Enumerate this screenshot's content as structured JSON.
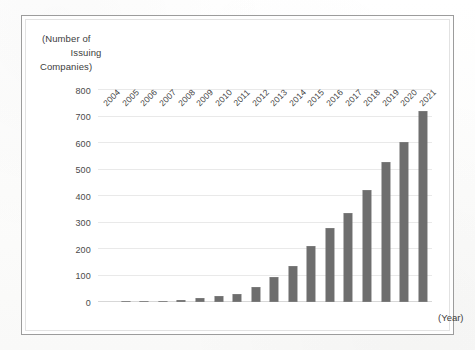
{
  "figure": {
    "frame_color": "#9c9c9c",
    "background_color": "#ffffff"
  },
  "y_axis_title": {
    "line1": "(Number of",
    "line2": "Issuing",
    "line3": "Companies)"
  },
  "x_axis_title": "(Year)",
  "chart_data": {
    "type": "bar",
    "title": "",
    "subtitle": "",
    "xlabel": "(Year)",
    "ylabel": "(Number of Issuing Companies)",
    "categories": [
      "2004",
      "2005",
      "2006",
      "2007",
      "2008",
      "2009",
      "2010",
      "2011",
      "2012",
      "2013",
      "2014",
      "2015",
      "2016",
      "2017",
      "2018",
      "2019",
      "2020",
      "2021"
    ],
    "values": [
      0,
      1,
      2,
      5,
      8,
      15,
      21,
      31,
      58,
      93,
      135,
      210,
      278,
      335,
      422,
      530,
      605,
      722
    ],
    "series": [
      {
        "name": "Number of Issuing Companies",
        "values": [
          0,
          1,
          2,
          5,
          8,
          15,
          21,
          31,
          58,
          93,
          135,
          210,
          278,
          335,
          422,
          530,
          605,
          722
        ],
        "color": "#6e6e6e"
      }
    ],
    "ylim": [
      0,
      800
    ],
    "ytick_labels": [
      "0",
      "100",
      "200",
      "300",
      "400",
      "500",
      "600",
      "700",
      "800"
    ],
    "ytick_values": [
      0,
      100,
      200,
      300,
      400,
      500,
      600,
      700,
      800
    ],
    "grid": true,
    "grid_orientation": "horizontal",
    "legend": false,
    "legend_position": "none",
    "bar_color": "#6e6e6e",
    "gridline_color": "#e9e9e9",
    "axis_color": "#d7d7d7"
  }
}
